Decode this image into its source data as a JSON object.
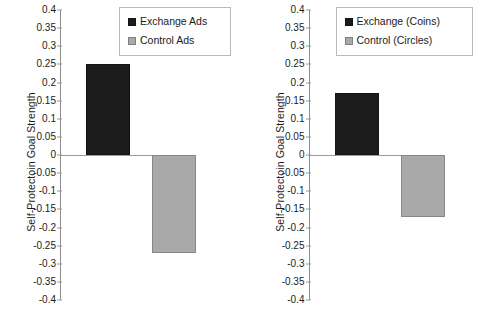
{
  "chart_data": [
    {
      "type": "bar",
      "panel": "left",
      "title": "",
      "xlabel": "",
      "ylabel": "Self-Protectoin Goal Strength",
      "categories": [
        "Exchange Ads",
        "Control Ads"
      ],
      "values": [
        0.25,
        -0.27
      ],
      "series": [
        {
          "name": "Exchange Ads",
          "values": [
            0.25
          ],
          "color": "#1c1c1c"
        },
        {
          "name": "Control Ads",
          "values": [
            -0.27
          ],
          "color": "#a9a9a9"
        }
      ],
      "ylim": [
        -0.4,
        0.4
      ],
      "ytick_step": 0.05,
      "yticks": [
        "0.4",
        "0.35",
        "0.3",
        "0.25",
        "0.2",
        "0.15",
        "0.1",
        "0.05",
        "0",
        "-0.05",
        "-0.1",
        "-0.15",
        "-0.2",
        "-0.25",
        "-0.3",
        "-0.35",
        "-0.4"
      ],
      "grid": false,
      "legend_position": "top-right",
      "legend": [
        {
          "label": "Exchange Ads",
          "swatch": "dark",
          "color": "#1c1c1c"
        },
        {
          "label": "Control Ads",
          "swatch": "gray",
          "color": "#a9a9a9"
        }
      ]
    },
    {
      "type": "bar",
      "panel": "right",
      "title": "",
      "xlabel": "",
      "ylabel": "Self-Protectoin Goal Strength",
      "categories": [
        "Exchange (Coins)",
        "Control (Circles)"
      ],
      "values": [
        0.17,
        -0.17
      ],
      "series": [
        {
          "name": "Exchange (Coins)",
          "values": [
            0.17
          ],
          "color": "#1c1c1c"
        },
        {
          "name": "Control (Circles)",
          "values": [
            -0.17
          ],
          "color": "#a9a9a9"
        }
      ],
      "ylim": [
        -0.4,
        0.4
      ],
      "ytick_step": 0.05,
      "yticks": [
        "0.4",
        "0.35",
        "0.3",
        "0.25",
        "0.2",
        "0.15",
        "0.1",
        "0.05",
        "0",
        "-0.05",
        "-0.1",
        "-0.15",
        "-0.2",
        "-0.25",
        "-0.3",
        "-0.35",
        "-0.4"
      ],
      "grid": false,
      "legend_position": "top-right",
      "legend": [
        {
          "label": "Exchange (Coins)",
          "swatch": "dark",
          "color": "#1c1c1c"
        },
        {
          "label": "Control (Circles)",
          "swatch": "gray",
          "color": "#a9a9a9"
        }
      ]
    }
  ]
}
